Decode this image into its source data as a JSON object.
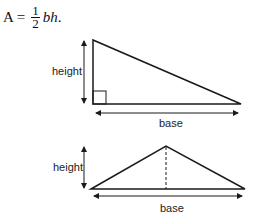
{
  "formula": {
    "lhs": "A",
    "equals": "=",
    "numerator": "1",
    "denominator": "2",
    "rhs": "bh",
    "period": "."
  },
  "figures": [
    {
      "type": "right-triangle",
      "height_label": "height",
      "base_label": "base",
      "right_angle_marker": true
    },
    {
      "type": "isosceles-triangle",
      "height_label": "height",
      "base_label": "base",
      "altitude_dashed": true
    }
  ],
  "colors": {
    "stroke": "#1a1a1a",
    "text": "#222222"
  }
}
